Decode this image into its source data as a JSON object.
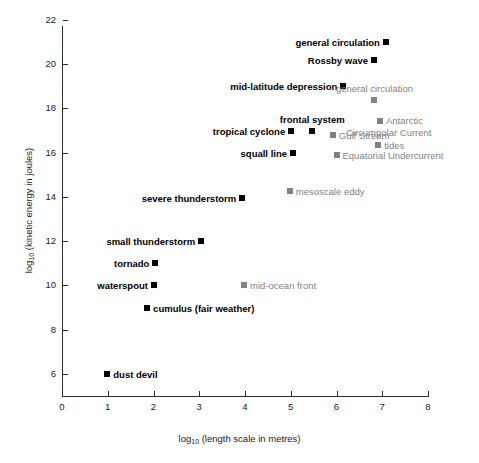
{
  "chart_data": {
    "type": "scatter",
    "title": "",
    "xlabel": "log10 (length scale in metres)",
    "ylabel": "log10 (kinetic energy in joules)",
    "xlim": [
      0,
      8.7
    ],
    "ylim": [
      5.0,
      22.4
    ],
    "xticks": [
      0,
      1,
      2,
      3,
      4,
      5,
      6,
      7,
      8
    ],
    "yticks": [
      6,
      8,
      10,
      12,
      14,
      16,
      18,
      20,
      22
    ],
    "grid": false,
    "legend": "none",
    "series": [
      {
        "name": "atmospheric phenomena",
        "color": "#000000",
        "marker": "square",
        "label_style": "bold",
        "points": [
          {
            "label": "general circulation",
            "x": 7.08,
            "y": 21.02,
            "label_pos": "left"
          },
          {
            "label": "Rossby wave",
            "x": 6.82,
            "y": 20.21,
            "label_pos": "left"
          },
          {
            "label": "mid-latitude depression",
            "x": 6.15,
            "y": 19.01,
            "label_pos": "left"
          },
          {
            "label": "frontal system",
            "x": 5.47,
            "y": 17.0,
            "label_pos": "above"
          },
          {
            "label": "tropical cyclone",
            "x": 5.01,
            "y": 17.0,
            "label_pos": "left"
          },
          {
            "label": "squall line",
            "x": 5.05,
            "y": 16.0,
            "label_pos": "left"
          },
          {
            "label": "severe thunderstorm",
            "x": 3.94,
            "y": 13.96,
            "label_pos": "left"
          },
          {
            "label": "small thunderstorm",
            "x": 3.04,
            "y": 12.01,
            "label_pos": "left"
          },
          {
            "label": "tornado",
            "x": 2.04,
            "y": 11.0,
            "label_pos": "left"
          },
          {
            "label": "waterspout",
            "x": 2.01,
            "y": 10.0,
            "label_pos": "left"
          },
          {
            "label": "cumulus (fair weather)",
            "x": 1.86,
            "y": 8.97,
            "label_pos": "right"
          },
          {
            "label": "dust devil",
            "x": 0.99,
            "y": 6.0,
            "label_pos": "right"
          }
        ]
      },
      {
        "name": "oceanic phenomena",
        "color": "#828282",
        "marker": "square",
        "label_style": "regular",
        "points": [
          {
            "label": "general circulation",
            "x": 6.83,
            "y": 18.37,
            "label_pos": "above"
          },
          {
            "label": "Antarctic Circumpolar Current",
            "x": 6.95,
            "y": 17.42,
            "label_pos": "right-two-line"
          },
          {
            "label": "Gulf Stream",
            "x": 5.92,
            "y": 16.82,
            "label_pos": "right"
          },
          {
            "label": "tides",
            "x": 6.91,
            "y": 16.36,
            "label_pos": "right"
          },
          {
            "label": "Equatorial Undercurrent",
            "x": 6.0,
            "y": 15.88,
            "label_pos": "right"
          },
          {
            "label": "mesoscale eddy",
            "x": 4.98,
            "y": 14.28,
            "label_pos": "right"
          },
          {
            "label": "mid-ocean front",
            "x": 3.98,
            "y": 10.0,
            "label_pos": "right"
          }
        ]
      }
    ],
    "annotations": [
      {
        "text": "Antarctic",
        "relates_to": "Antarctic Circumpolar Current",
        "line": 1
      },
      {
        "text": "Circumpolar Current",
        "relates_to": "Antarctic Circumpolar Current",
        "line": 2
      }
    ]
  },
  "axis": {
    "x_title_prefix": "log",
    "x_title_sub": "10",
    "x_title_suffix": " (length scale in metres)",
    "y_title_prefix": "log",
    "y_title_sub": "10",
    "y_title_suffix": " (kinetic energy in joules)",
    "xtick_labels": [
      "0",
      "1",
      "2",
      "3",
      "4",
      "5",
      "6",
      "7",
      "8"
    ],
    "ytick_labels": [
      "6",
      "8",
      "10",
      "12",
      "14",
      "16",
      "18",
      "20",
      "22"
    ]
  },
  "colors": {
    "atmospheric": "#000000",
    "oceanic": "#828282",
    "axis": "#2b2b2b",
    "background": "#ffffff"
  }
}
